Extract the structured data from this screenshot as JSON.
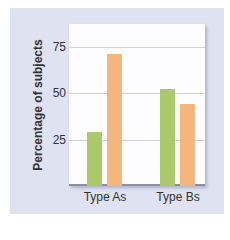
{
  "chart_data": {
    "type": "bar",
    "title": "",
    "xlabel": "",
    "ylabel": "Percentage of subjects",
    "categories": [
      "Type As",
      "Type Bs"
    ],
    "series": [
      {
        "name": "Series 1 (green)",
        "color": "#a9c96b",
        "values": [
          29,
          52
        ]
      },
      {
        "name": "Series 2 (orange)",
        "color": "#f4b67c",
        "values": [
          71,
          44
        ]
      }
    ],
    "yticks": [
      "25",
      "50",
      "75"
    ],
    "ylim": [
      0,
      87
    ],
    "grid": true,
    "legend": "none"
  },
  "colors": {
    "panel_bg": "#dfe2f1",
    "plot_bg": "#fdfdff",
    "green": "#a9c96b",
    "orange": "#f4b67c"
  }
}
